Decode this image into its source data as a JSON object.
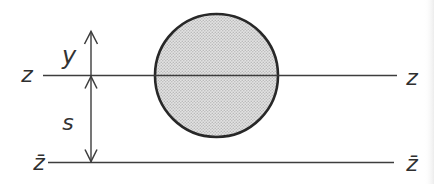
{
  "figure": {
    "background": "#ffffff",
    "line_color": "#3d3d3d",
    "arrow_color": "#3d3d3d",
    "circle_stroke": "#282828",
    "circle_fill_tone": "#d0d0d0",
    "labels": {
      "z_left": "z",
      "z_right": "z",
      "zbar_left": "z̄",
      "zbar_right": "z̄",
      "y": "y",
      "s": "s"
    }
  }
}
